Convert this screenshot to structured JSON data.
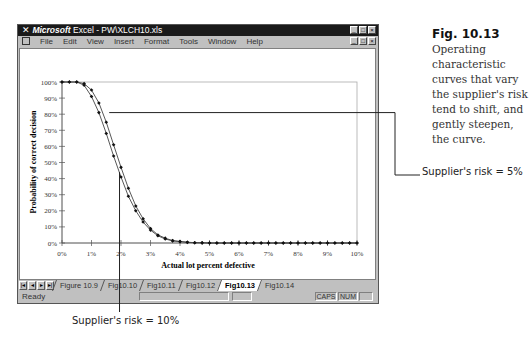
{
  "window": {
    "title_brand": "Microsoft",
    "title_rest": " Excel - PW\\XLCH10.xls",
    "window_buttons": [
      "minimize",
      "maximize",
      "close"
    ]
  },
  "menu": {
    "items": [
      "File",
      "Edit",
      "View",
      "Insert",
      "Format",
      "Tools",
      "Window",
      "Help"
    ]
  },
  "sheet_tabs": {
    "nav": [
      "first",
      "prev",
      "next",
      "last"
    ],
    "tabs": [
      {
        "label": "Figure 10.9",
        "active": false
      },
      {
        "label": "Fig10.10",
        "active": false
      },
      {
        "label": "Fig10.11",
        "active": false
      },
      {
        "label": "Fig10.12",
        "active": false
      },
      {
        "label": "Fig10.13",
        "active": true
      },
      {
        "label": "Fig10.14",
        "active": false
      }
    ]
  },
  "status": {
    "ready": "Ready",
    "caps": "CAPS",
    "num": "NUM"
  },
  "caption": {
    "fig_number": "Fig. 10.13",
    "text": "Operating characteristic curves that vary the supplier's risk tend to shift, and gently steepen, the curve."
  },
  "callouts": {
    "risk5": "Supplier's risk = 5%",
    "risk10": "Supplier's risk = 10%"
  },
  "chart_data": {
    "type": "line",
    "title": "",
    "xlabel": "Actual lot percent defective",
    "ylabel": "Probability of correct decision",
    "xlim": [
      0,
      10
    ],
    "ylim": [
      0,
      100
    ],
    "x_ticks": [
      "0%",
      "1%",
      "2%",
      "3%",
      "4%",
      "5%",
      "6%",
      "7%",
      "8%",
      "9%",
      "10%"
    ],
    "y_ticks": [
      "0%",
      "10%",
      "20%",
      "30%",
      "40%",
      "50%",
      "60%",
      "70%",
      "80%",
      "90%",
      "100%"
    ],
    "grid": false,
    "legend": "none",
    "x": [
      0,
      0.25,
      0.5,
      0.75,
      1,
      1.25,
      1.5,
      1.75,
      2,
      2.25,
      2.5,
      2.75,
      3,
      3.25,
      3.5,
      3.75,
      4,
      4.25,
      4.5,
      4.75,
      5,
      5.25,
      5.5,
      5.75,
      6,
      6.25,
      6.5,
      6.75,
      7,
      7.25,
      7.5,
      7.75,
      8,
      8.25,
      8.5,
      8.75,
      9,
      9.25,
      9.5,
      9.75,
      10
    ],
    "series": [
      {
        "name": "Supplier's risk = 5%",
        "values": [
          100,
          100,
          100,
          99,
          95,
          87,
          75,
          61,
          47,
          34,
          23,
          15,
          9,
          5,
          3,
          1.5,
          1,
          0.5,
          0.2,
          0.1,
          0,
          0,
          0,
          0,
          0,
          0,
          0,
          0,
          0,
          0,
          0,
          0,
          0,
          0,
          0,
          0,
          0,
          0,
          0,
          0,
          0
        ]
      },
      {
        "name": "Supplier's risk = 10%",
        "values": [
          100,
          100,
          100,
          98,
          91,
          81,
          68,
          54,
          41,
          29,
          20,
          13,
          8,
          4.5,
          2.5,
          1.3,
          0.8,
          0.4,
          0.2,
          0.1,
          0,
          0,
          0,
          0,
          0,
          0,
          0,
          0,
          0,
          0,
          0,
          0,
          0,
          0,
          0,
          0,
          0,
          0,
          0,
          0,
          0
        ]
      }
    ]
  }
}
